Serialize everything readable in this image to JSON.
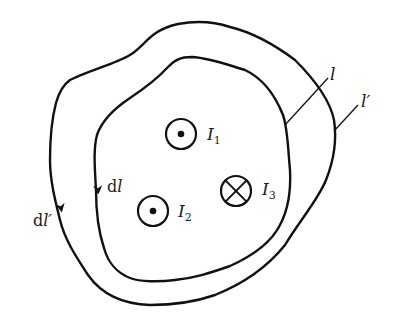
{
  "diagram": {
    "type": "ampere-loop-diagram",
    "colors": {
      "stroke": "#111111",
      "background": "#ffffff"
    },
    "loops": [
      {
        "id": "inner",
        "label": "l",
        "element_label": "dl",
        "direction": "counterclockwise (arrow pointing down on left side)"
      },
      {
        "id": "outer",
        "label": "l′",
        "element_label": "dl′",
        "direction": "counterclockwise (arrow pointing down on left side)"
      }
    ],
    "currents": [
      {
        "id": "I1",
        "label": "I",
        "subscript": "1",
        "symbol": "dot-out-of-page",
        "inside_loops": [
          "inner",
          "outer"
        ]
      },
      {
        "id": "I2",
        "label": "I",
        "subscript": "2",
        "symbol": "dot-out-of-page",
        "inside_loops": [
          "inner",
          "outer"
        ]
      },
      {
        "id": "I3",
        "label": "I",
        "subscript": "3",
        "symbol": "cross-into-page",
        "inside_loops": [
          "inner",
          "outer"
        ]
      }
    ],
    "labels": {
      "inner_loop": "l",
      "outer_loop": "l′",
      "inner_element": "dl",
      "outer_element": "dl′",
      "d_prefix": "d"
    }
  }
}
